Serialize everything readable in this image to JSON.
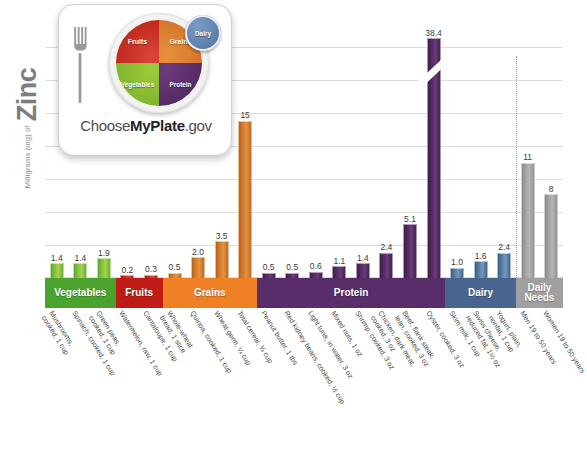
{
  "axis": {
    "y_title_small": "Milligrams (mg) of",
    "y_title_big": "Zinc"
  },
  "logo": {
    "brand_pre": "Choose",
    "brand_mid": "MyPlate",
    "brand_post": ".gov",
    "plate_fruits": "Fruits",
    "plate_grains": "Grains",
    "plate_vegetables": "Vegetables",
    "plate_protein": "Protein",
    "plate_dairy": "Dairy"
  },
  "categories": [
    {
      "label": "Vegetables",
      "color": "#4aa32e"
    },
    {
      "label": "Fruits",
      "color": "#c01b17"
    },
    {
      "label": "Grains",
      "color": "#ef8024"
    },
    {
      "label": "Protein",
      "color": "#582d6a"
    },
    {
      "label": "Dairy",
      "color": "#49658f"
    },
    {
      "label": "Daily\nNeeds",
      "color": "#a0a0a0"
    }
  ],
  "chart_data": {
    "type": "bar",
    "xlabel": "",
    "ylabel": "Milligrams (mg) of Zinc",
    "ylim": [
      0,
      16
    ],
    "grid": true,
    "legend_position": "none",
    "axis_break": {
      "present": true,
      "on_bar": "Oyster, cooked, 3 oz",
      "true_value": 38.4
    },
    "value_unit": "mg",
    "categories": [
      "Mushrooms, cooked, 1 cup",
      "Spinach, cooked, 1 cup",
      "Green peas, cooked, 1 cup",
      "Watermelon, raw, 1 cup",
      "Cantaloupe, 1 cup",
      "Whole-wheat bread, 1 slice",
      "Quinoa, cooked, 1 cup",
      "Wheat germ, ¼ cup",
      "Total cereal, ¾ cup",
      "Peanut butter, 1 tbs",
      "Red kidney beans, cooked, ½ cup",
      "Light tuna, in water, 3 oz",
      "Mixed nuts, 1 oz",
      "Shrimp, cooked, 3 oz",
      "Chicken, dark meat, cooked, 3 oz",
      "Beef, flank steak, lean, cooked, 3 oz",
      "Oyster, cooked, 3 oz",
      "Skim milk, 1 cup",
      "Swiss cheese, reduced fat, 1½ oz",
      "Yogurt, plain, nonfat, 1 cup",
      "Men 19 to 50 years",
      "Women 19 to 50 years"
    ],
    "values": [
      1.4,
      1.4,
      1.9,
      0.2,
      0.3,
      0.5,
      2.0,
      3.5,
      15,
      0.5,
      0.5,
      0.6,
      1.1,
      1.4,
      2.4,
      5.1,
      38.4,
      1.0,
      1.6,
      2.4,
      11,
      8
    ],
    "groups": [
      "Vegetables",
      "Vegetables",
      "Vegetables",
      "Fruits",
      "Fruits",
      "Grains",
      "Grains",
      "Grains",
      "Grains",
      "Protein",
      "Protein",
      "Protein",
      "Protein",
      "Protein",
      "Protein",
      "Protein",
      "Protein",
      "Dairy",
      "Dairy",
      "Dairy",
      "Daily Needs",
      "Daily Needs"
    ]
  },
  "bars": [
    {
      "value_label": "1.4",
      "label_lines": [
        "Mushrooms,",
        "cooked, 1 cup"
      ]
    },
    {
      "value_label": "1.4",
      "label_lines": [
        "Spinach, cooked, 1 cup"
      ]
    },
    {
      "value_label": "1.9",
      "label_lines": [
        "Green peas,",
        "cooked, 1 cup"
      ]
    },
    {
      "value_label": "0.2",
      "label_lines": [
        "Watermelon, raw, 1 cup"
      ]
    },
    {
      "value_label": "0.3",
      "label_lines": [
        "Cantaloupe, 1 cup"
      ]
    },
    {
      "value_label": "0.5",
      "label_lines": [
        "Whole-wheat",
        "bread, 1 slice"
      ]
    },
    {
      "value_label": "2.0",
      "label_lines": [
        "Quinoa, cooked, 1 cup"
      ]
    },
    {
      "value_label": "3.5",
      "label_lines": [
        "Wheat germ, ¼ cup"
      ]
    },
    {
      "value_label": "15",
      "label_lines": [
        "Total cereal, ¾ cup"
      ]
    },
    {
      "value_label": "0.5",
      "label_lines": [
        "Peanut butter, 1 tbs"
      ]
    },
    {
      "value_label": "0.5",
      "label_lines": [
        "Red kidney beans, cooked, ½ cup"
      ]
    },
    {
      "value_label": "0.6",
      "label_lines": [
        "Light tuna, in water, 3 oz"
      ]
    },
    {
      "value_label": "1.1",
      "label_lines": [
        "Mixed nuts, 1 oz"
      ]
    },
    {
      "value_label": "1.4",
      "label_lines": [
        "Shrimp, cooked, 3 oz"
      ]
    },
    {
      "value_label": "2.4",
      "label_lines": [
        "Chicken, dark meat,",
        "cooked, 3 oz"
      ]
    },
    {
      "value_label": "5.1",
      "label_lines": [
        "Beef, flank steak,",
        "lean, cooked, 3 oz"
      ]
    },
    {
      "value_label": "38.4",
      "label_lines": [
        "Oyster, cooked, 3 oz"
      ]
    },
    {
      "value_label": "1.0",
      "label_lines": [
        "Skim milk, 1 cup"
      ]
    },
    {
      "value_label": "1.6",
      "label_lines": [
        "Swiss cheese,",
        "reduced fat, 1½ oz"
      ]
    },
    {
      "value_label": "2.4",
      "label_lines": [
        "Yogurt, plain,",
        "nonfat, 1 cup"
      ]
    },
    {
      "value_label": "11",
      "label_lines": [
        "Men 19 to 50 years"
      ]
    },
    {
      "value_label": "8",
      "label_lines": [
        "Women 19 to 50 years"
      ]
    }
  ]
}
